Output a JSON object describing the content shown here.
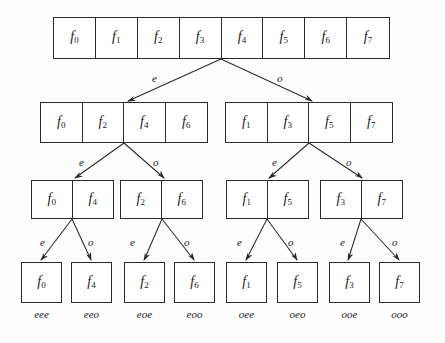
{
  "figure": {
    "type": "recursion-tree-diagram",
    "title": "",
    "ink_color": "#2b2b2b",
    "background_color": "#fdfdfd",
    "edge_labels": {
      "even": "e",
      "odd": "o"
    }
  },
  "levels": [
    {
      "level": 0,
      "arrays": [
        {
          "id": "root",
          "cells": [
            {
              "base": "f",
              "sub": "0"
            },
            {
              "base": "f",
              "sub": "1"
            },
            {
              "base": "f",
              "sub": "2"
            },
            {
              "base": "f",
              "sub": "3"
            },
            {
              "base": "f",
              "sub": "4"
            },
            {
              "base": "f",
              "sub": "5"
            },
            {
              "base": "f",
              "sub": "6"
            },
            {
              "base": "f",
              "sub": "7"
            }
          ]
        }
      ]
    },
    {
      "level": 1,
      "arrays": [
        {
          "id": "L1-even",
          "cells": [
            {
              "base": "f",
              "sub": "0"
            },
            {
              "base": "f",
              "sub": "2"
            },
            {
              "base": "f",
              "sub": "4"
            },
            {
              "base": "f",
              "sub": "6"
            }
          ]
        },
        {
          "id": "L1-odd",
          "cells": [
            {
              "base": "f",
              "sub": "1"
            },
            {
              "base": "f",
              "sub": "3"
            },
            {
              "base": "f",
              "sub": "5"
            },
            {
              "base": "f",
              "sub": "7"
            }
          ]
        }
      ]
    },
    {
      "level": 2,
      "arrays": [
        {
          "id": "L2-ee",
          "cells": [
            {
              "base": "f",
              "sub": "0"
            },
            {
              "base": "f",
              "sub": "4"
            }
          ]
        },
        {
          "id": "L2-eo",
          "cells": [
            {
              "base": "f",
              "sub": "2"
            },
            {
              "base": "f",
              "sub": "6"
            }
          ]
        },
        {
          "id": "L2-oe",
          "cells": [
            {
              "base": "f",
              "sub": "1"
            },
            {
              "base": "f",
              "sub": "5"
            }
          ]
        },
        {
          "id": "L2-oo",
          "cells": [
            {
              "base": "f",
              "sub": "3"
            },
            {
              "base": "f",
              "sub": "7"
            }
          ]
        }
      ]
    },
    {
      "level": 3,
      "arrays": [
        {
          "id": "leaf-eee",
          "cells": [
            {
              "base": "f",
              "sub": "0"
            }
          ],
          "path_label": "eee"
        },
        {
          "id": "leaf-eeo",
          "cells": [
            {
              "base": "f",
              "sub": "4"
            }
          ],
          "path_label": "eeo"
        },
        {
          "id": "leaf-eoe",
          "cells": [
            {
              "base": "f",
              "sub": "2"
            }
          ],
          "path_label": "eoe"
        },
        {
          "id": "leaf-eoo",
          "cells": [
            {
              "base": "f",
              "sub": "6"
            }
          ],
          "path_label": "eoo"
        },
        {
          "id": "leaf-oee",
          "cells": [
            {
              "base": "f",
              "sub": "1"
            }
          ],
          "path_label": "oee"
        },
        {
          "id": "leaf-oeo",
          "cells": [
            {
              "base": "f",
              "sub": "5"
            }
          ],
          "path_label": "oeo"
        },
        {
          "id": "leaf-ooe",
          "cells": [
            {
              "base": "f",
              "sub": "3"
            }
          ],
          "path_label": "ooe"
        },
        {
          "id": "leaf-ooo",
          "cells": [
            {
              "base": "f",
              "sub": "7"
            }
          ],
          "path_label": "ooo"
        }
      ]
    }
  ],
  "edges": [
    {
      "from": "root",
      "to": "L1-even",
      "label": "e"
    },
    {
      "from": "root",
      "to": "L1-odd",
      "label": "o"
    },
    {
      "from": "L1-even",
      "to": "L2-ee",
      "label": "e"
    },
    {
      "from": "L1-even",
      "to": "L2-eo",
      "label": "o"
    },
    {
      "from": "L1-odd",
      "to": "L2-oe",
      "label": "e"
    },
    {
      "from": "L1-odd",
      "to": "L2-oo",
      "label": "o"
    },
    {
      "from": "L2-ee",
      "to": "leaf-eee",
      "label": "e"
    },
    {
      "from": "L2-ee",
      "to": "leaf-eeo",
      "label": "o"
    },
    {
      "from": "L2-eo",
      "to": "leaf-eoe",
      "label": "e"
    },
    {
      "from": "L2-eo",
      "to": "leaf-eoo",
      "label": "o"
    },
    {
      "from": "L2-oe",
      "to": "leaf-oee",
      "label": "e"
    },
    {
      "from": "L2-oe",
      "to": "leaf-oeo",
      "label": "o"
    },
    {
      "from": "L2-oo",
      "to": "leaf-ooe",
      "label": "e"
    },
    {
      "from": "L2-oo",
      "to": "leaf-ooo",
      "label": "o"
    }
  ]
}
